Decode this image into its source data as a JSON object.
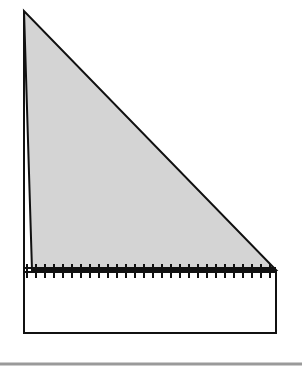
{
  "diagram": {
    "colors": {
      "background": "#ffffff",
      "stroke": "#111111",
      "fill": "#d4d4d4",
      "rule": "#9a9a9a"
    },
    "triangle": {
      "apex": [
        24,
        11
      ],
      "base_left": [
        32,
        270
      ],
      "base_right": [
        276,
        270
      ]
    },
    "outer_left_line": {
      "x": 24,
      "y1": 11,
      "y2": 333
    },
    "base_line": {
      "y_top": 268,
      "y_bottom": 272,
      "x1": 24,
      "x2": 276
    },
    "ticks": {
      "count": 28,
      "x_start": 27,
      "x_end": 270,
      "y1": 264,
      "y2": 278
    },
    "rectangle": {
      "x": 24,
      "y": 272,
      "width": 252,
      "height": 61
    },
    "rule": {
      "y": 364,
      "x1": 0,
      "x2": 302
    }
  }
}
